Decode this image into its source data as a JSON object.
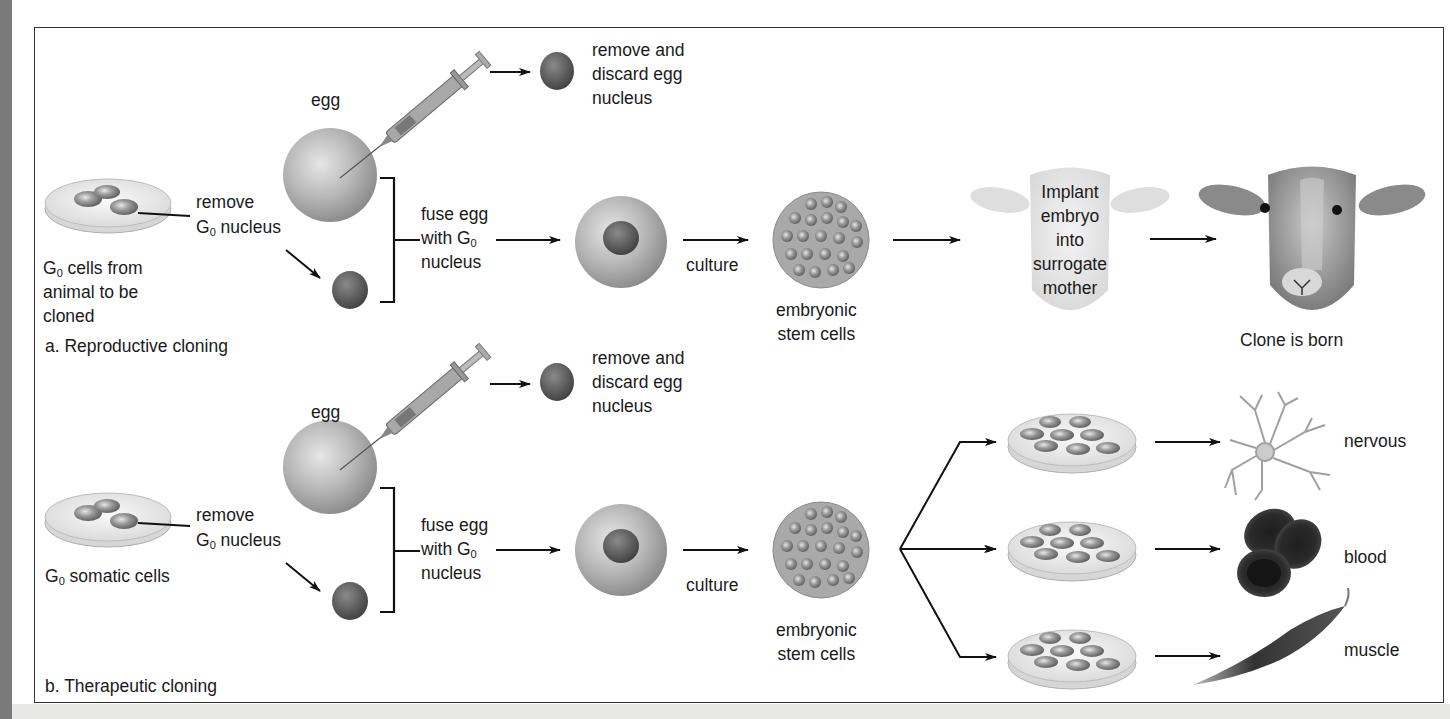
{
  "diagram": {
    "panel_a": {
      "title": "a. Reproductive cloning",
      "source_label": [
        "G",
        "0",
        " cells from",
        "animal to be",
        "cloned"
      ],
      "remove_label": [
        "remove",
        "G",
        "0",
        " nucleus"
      ],
      "egg_label": "egg",
      "discard_label": [
        "remove and",
        "discard egg",
        "nucleus"
      ],
      "fuse_label": [
        "fuse egg",
        "with G",
        "0",
        "nucleus"
      ],
      "culture_label": "culture",
      "stem_label": [
        "embryonic",
        "stem cells"
      ],
      "implant_label": [
        "Implant",
        "embryo",
        "into",
        "surrogate",
        "mother"
      ],
      "clone_label": "Clone is born"
    },
    "panel_b": {
      "title": "b. Therapeutic cloning",
      "source_label": [
        "G",
        "0",
        " somatic cells"
      ],
      "remove_label": [
        "remove",
        "G",
        "0",
        " nucleus"
      ],
      "egg_label": "egg",
      "discard_label": [
        "remove and",
        "discard egg",
        "nucleus"
      ],
      "fuse_label": [
        "fuse egg",
        "with G",
        "0",
        "nucleus"
      ],
      "culture_label": "culture",
      "stem_label": [
        "embryonic",
        "stem cells"
      ],
      "tissues": [
        {
          "label": "nervous",
          "icon": "neuron-icon"
        },
        {
          "label": "blood",
          "icon": "red-blood-cells-icon"
        },
        {
          "label": "muscle",
          "icon": "muscle-cell-icon"
        }
      ]
    },
    "colors": {
      "frame": "#333333",
      "text": "#1a1a1a",
      "arrow": "#111111",
      "left_bar": "#7a7a7a"
    }
  }
}
